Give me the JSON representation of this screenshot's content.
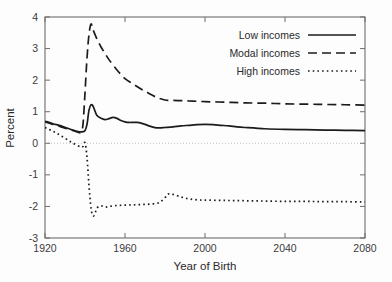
{
  "chart_data": {
    "type": "line",
    "title": "",
    "xlabel": "Year of Birth",
    "ylabel": "Percent",
    "xlim": [
      1920,
      2080
    ],
    "ylim": [
      -3,
      4
    ],
    "xticks": [
      1920,
      1960,
      2000,
      2040,
      2080
    ],
    "xtick_labels": [
      "1920",
      "1960",
      "2000",
      "2040",
      "2080"
    ],
    "yticks": [
      -3,
      -2,
      -1,
      0,
      1,
      2,
      3,
      4
    ],
    "ytick_labels": [
      "-3",
      "-2",
      "-1",
      "0",
      "1",
      "2",
      "3",
      "4"
    ],
    "grid": false,
    "zero_reference_line": true,
    "legend_position": "top-right",
    "legend": [
      {
        "label": "Low incomes",
        "style": "solid"
      },
      {
        "label": "Modal incomes",
        "style": "dashed"
      },
      {
        "label": "High incomes",
        "style": "dotted"
      }
    ],
    "series": [
      {
        "name": "Low incomes",
        "style": "solid",
        "x": [
          1920,
          1924,
          1928,
          1932,
          1936,
          1938,
          1939,
          1940,
          1941,
          1942,
          1943,
          1944,
          1945,
          1946,
          1948,
          1950,
          1952,
          1954,
          1956,
          1958,
          1960,
          1962,
          1964,
          1966,
          1968,
          1970,
          1972,
          1974,
          1976,
          1978,
          1980,
          1984,
          1988,
          1992,
          1996,
          2000,
          2004,
          2008,
          2012,
          2016,
          2020,
          2030,
          2040,
          2050,
          2060,
          2070,
          2080
        ],
        "y": [
          0.7,
          0.62,
          0.55,
          0.46,
          0.38,
          0.36,
          0.37,
          0.4,
          0.6,
          1.05,
          1.22,
          1.18,
          1.02,
          0.88,
          0.79,
          0.75,
          0.78,
          0.82,
          0.79,
          0.72,
          0.68,
          0.66,
          0.66,
          0.66,
          0.64,
          0.6,
          0.55,
          0.51,
          0.49,
          0.49,
          0.5,
          0.52,
          0.55,
          0.57,
          0.59,
          0.6,
          0.59,
          0.57,
          0.55,
          0.52,
          0.5,
          0.46,
          0.44,
          0.43,
          0.42,
          0.41,
          0.4
        ]
      },
      {
        "name": "Modal incomes",
        "style": "dashed",
        "x": [
          1920,
          1924,
          1928,
          1932,
          1936,
          1938,
          1939,
          1940,
          1941,
          1942,
          1943,
          1944,
          1946,
          1948,
          1950,
          1952,
          1956,
          1960,
          1964,
          1968,
          1972,
          1976,
          1980,
          1982,
          1984,
          1988,
          1992,
          1996,
          2000,
          2010,
          2020,
          2030,
          2040,
          2050,
          2060,
          2070,
          2080
        ],
        "y": [
          0.68,
          0.6,
          0.52,
          0.44,
          0.36,
          0.35,
          0.6,
          1.6,
          2.7,
          3.45,
          3.78,
          3.6,
          3.3,
          3.05,
          2.85,
          2.65,
          2.32,
          2.05,
          1.88,
          1.72,
          1.58,
          1.45,
          1.37,
          1.36,
          1.36,
          1.35,
          1.34,
          1.33,
          1.32,
          1.3,
          1.28,
          1.27,
          1.25,
          1.24,
          1.23,
          1.22,
          1.21
        ]
      },
      {
        "name": "High incomes",
        "style": "dotted",
        "x": [
          1920,
          1924,
          1928,
          1932,
          1934,
          1936,
          1938,
          1939,
          1940,
          1941,
          1942,
          1943,
          1944,
          1945,
          1946,
          1948,
          1950,
          1952,
          1956,
          1960,
          1964,
          1968,
          1972,
          1976,
          1978,
          1980,
          1981,
          1982,
          1984,
          1988,
          1992,
          1996,
          2000,
          2010,
          2020,
          2030,
          2040,
          2050,
          2060,
          2070,
          2080
        ],
        "y": [
          0.5,
          0.38,
          0.24,
          0.08,
          0.0,
          -0.06,
          -0.12,
          -0.1,
          0.02,
          -0.45,
          -1.35,
          -2.05,
          -2.3,
          -2.22,
          -2.05,
          -1.98,
          -2.02,
          -2.0,
          -1.97,
          -1.96,
          -1.95,
          -1.94,
          -1.93,
          -1.9,
          -1.84,
          -1.72,
          -1.64,
          -1.6,
          -1.62,
          -1.7,
          -1.76,
          -1.79,
          -1.8,
          -1.81,
          -1.82,
          -1.83,
          -1.84,
          -1.84,
          -1.85,
          -1.85,
          -1.86
        ]
      }
    ]
  },
  "plot_geometry": {
    "left": 45,
    "right": 365,
    "top": 17,
    "bottom": 238
  },
  "stroke_styles": {
    "solid": {
      "width": 1.7,
      "dash": ""
    },
    "dashed": {
      "width": 1.7,
      "dash": "9 5"
    },
    "dotted": {
      "width": 1.7,
      "dash": "1.6 3.1"
    }
  }
}
